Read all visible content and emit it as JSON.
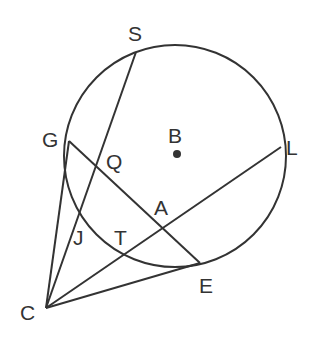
{
  "diagram": {
    "type": "geometry",
    "stroke_color": "#333333",
    "background": "#ffffff",
    "circle": {
      "center_label": "B",
      "cx": 175,
      "cy": 156,
      "r": 111
    },
    "points": {
      "C": {
        "label": "C",
        "x": 46,
        "y": 308
      },
      "S": {
        "label": "S",
        "x": 136,
        "y": 52
      },
      "G": {
        "label": "G",
        "x": 69,
        "y": 141
      },
      "L": {
        "label": "L",
        "x": 281,
        "y": 147
      },
      "E": {
        "label": "E",
        "x": 200,
        "y": 263
      },
      "B": {
        "label": "B",
        "x": 177,
        "y": 154
      },
      "Q": {
        "label": "Q",
        "x": 96,
        "y": 167
      },
      "A": {
        "label": "A",
        "x": 162,
        "y": 227
      },
      "J": {
        "label": "J",
        "x": 80,
        "y": 207
      },
      "T": {
        "label": "T",
        "x": 123,
        "y": 253
      }
    },
    "labels": {
      "S": "S",
      "G": "G",
      "Q": "Q",
      "B": "B",
      "L": "L",
      "A": "A",
      "J": "J",
      "T": "T",
      "E": "E",
      "C": "C"
    },
    "segments": [
      {
        "name": "CG",
        "from": "C",
        "to": "G"
      },
      {
        "name": "CS",
        "from": "C",
        "to": "S"
      },
      {
        "name": "CL",
        "from": "C",
        "to": "L"
      },
      {
        "name": "CE",
        "from": "C",
        "to": "E"
      },
      {
        "name": "GE",
        "from": "G",
        "to": "E"
      }
    ]
  }
}
